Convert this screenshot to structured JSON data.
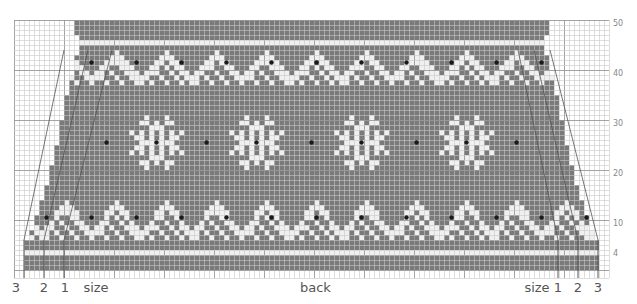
{
  "chart": {
    "title": "back",
    "cell_px": 5,
    "grid_origin": {
      "x": 14,
      "y": 20
    },
    "cols": 119,
    "rows": 50,
    "colors": {
      "background": "#ffffff",
      "grid_line": "#c8c8c8",
      "grid_line_major": "#9a9a9a",
      "contrast_stitch": "#7a7a7a",
      "main_stitch": "#f0f0f0",
      "dot": "#1a1a1a",
      "size_line": "#555555"
    },
    "row_labels": [
      {
        "text": "50",
        "row": 50
      },
      {
        "text": "40",
        "row": 40
      },
      {
        "text": "30",
        "row": 30
      },
      {
        "text": "20",
        "row": 20
      },
      {
        "text": "10",
        "row": 10
      },
      {
        "text": "4",
        "row": 4
      }
    ],
    "size_labels_left": [
      {
        "text": "3",
        "x": 16
      },
      {
        "text": "2",
        "x": 44
      },
      {
        "text": "1",
        "x": 65
      },
      {
        "text": "size",
        "x": 96
      }
    ],
    "size_labels_right": [
      {
        "text": "size",
        "x": 537
      },
      {
        "text": "1",
        "x": 558
      },
      {
        "text": "2",
        "x": 578
      },
      {
        "text": "3",
        "x": 598
      }
    ],
    "caption": {
      "text": "back",
      "x": 300
    },
    "body_edges": [
      {
        "from_row": 1,
        "to_row": 6,
        "left_col": 2,
        "right_col": 116
      },
      {
        "from_row": 7,
        "to_row": 8,
        "left_col": 3,
        "right_col": 115
      },
      {
        "from_row": 9,
        "to_row": 11,
        "left_col": 4,
        "right_col": 114
      },
      {
        "from_row": 12,
        "to_row": 14,
        "left_col": 5,
        "right_col": 113
      },
      {
        "from_row": 15,
        "to_row": 17,
        "left_col": 6,
        "right_col": 112
      },
      {
        "from_row": 18,
        "to_row": 21,
        "left_col": 7,
        "right_col": 111
      },
      {
        "from_row": 22,
        "to_row": 25,
        "left_col": 8,
        "right_col": 110
      },
      {
        "from_row": 26,
        "to_row": 30,
        "left_col": 9,
        "right_col": 109
      },
      {
        "from_row": 31,
        "to_row": 35,
        "left_col": 10,
        "right_col": 108
      },
      {
        "from_row": 36,
        "to_row": 39,
        "left_col": 11,
        "right_col": 107
      },
      {
        "from_row": 40,
        "to_row": 43,
        "left_col": 12,
        "right_col": 106
      },
      {
        "from_row": 44,
        "to_row": 47,
        "left_col": 13,
        "right_col": 105
      },
      {
        "from_row": 48,
        "to_row": 50,
        "left_col": 12,
        "right_col": 106
      }
    ],
    "top_edge": {
      "row": 50,
      "left_col": 12,
      "right_col": 106
    },
    "bands": [
      {
        "name": "hem-solid",
        "rows": [
          1,
          2,
          3
        ],
        "type": "solid"
      },
      {
        "name": "hem-light",
        "rows": [
          4
        ],
        "type": "light"
      },
      {
        "name": "hem-solid-2",
        "rows": [
          5,
          6
        ],
        "type": "solid"
      },
      {
        "name": "lower-zigzag",
        "rows": [
          7,
          15
        ],
        "type": "zigzag",
        "dot_row": 11,
        "repeat": 9
      },
      {
        "name": "motif-band",
        "rows": [
          16,
          37
        ],
        "type": "snowflake",
        "dot_row": 26
      },
      {
        "name": "upper-zigzag",
        "rows": [
          38,
          45
        ],
        "type": "zigzag",
        "dot_row": 42,
        "repeat": 9
      },
      {
        "name": "top-light",
        "rows": [
          46
        ],
        "type": "light"
      },
      {
        "name": "top-solid",
        "rows": [
          47,
          50
        ],
        "type": "solid"
      }
    ],
    "snowflake_centers_col": [
      28,
      48,
      69,
      90,
      110
    ],
    "snowflake_motifs": [
      28,
      48,
      69,
      90
    ],
    "dot_between_cols": [
      18,
      38,
      59,
      80,
      100
    ],
    "size_lines": {
      "left": [
        {
          "size": "3",
          "x": 24
        },
        {
          "size": "2",
          "x": 44
        },
        {
          "size": "1",
          "x": 64
        }
      ],
      "right": [
        {
          "size": "1",
          "x": 558
        },
        {
          "size": "2",
          "x": 578
        },
        {
          "size": "3",
          "x": 598
        }
      ]
    }
  }
}
